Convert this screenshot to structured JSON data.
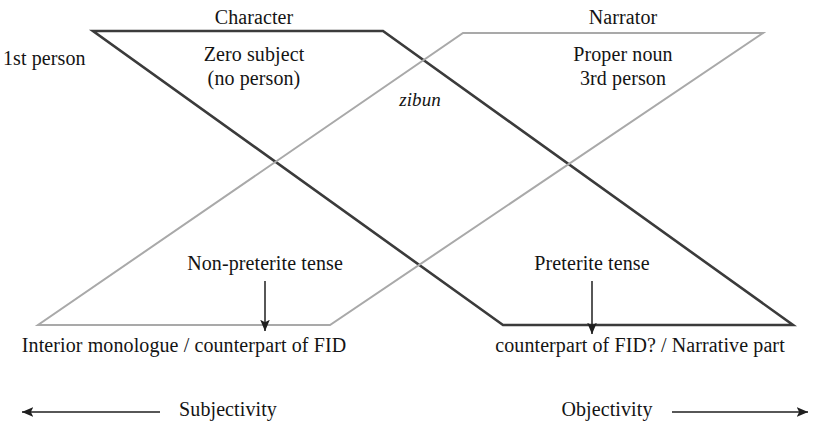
{
  "figure": {
    "colors": {
      "character_stroke": "#3b3b3b",
      "narrator_stroke": "#a9a9a9",
      "text": "#141414",
      "background": "#ffffff"
    }
  },
  "labels": {
    "character": "Character",
    "narrator": "Narrator",
    "first_person": "1st person",
    "zero_subject": "Zero subject\n(no person)",
    "zero_subject_line1": "Zero subject",
    "zero_subject_line2": "(no person)",
    "proper_noun_line1": "Proper noun",
    "proper_noun_line2": "3rd person",
    "zibun": "zibun",
    "non_preterite": "Non-preterite tense",
    "preterite": "Preterite tense",
    "interior_monologue": "Interior monologue / counterpart of FID",
    "narrative_part": "counterpart of FID? / Narrative part",
    "subjectivity": "Subjectivity",
    "objectivity": "Objectivity"
  },
  "shapes": {
    "character_parallelogram": {
      "name": "Character",
      "stroke": "#3b3b3b",
      "points": "93,31 383,31 793,325 503,325"
    },
    "narrator_parallelogram": {
      "name": "Narrator",
      "stroke": "#a9a9a9",
      "points": "463,33 763,33 330,325 38,325"
    }
  },
  "arrows": {
    "non_preterite_pointer": {
      "x": 265,
      "y_from": 281,
      "y_to": 331,
      "direction": "down"
    },
    "preterite_pointer": {
      "x": 592,
      "y_from": 281,
      "y_to": 334,
      "direction": "down"
    },
    "subjectivity_axis": {
      "y": 412,
      "x_from": 160,
      "x_to": 21,
      "direction": "left"
    },
    "objectivity_axis": {
      "y": 412,
      "x_from": 672,
      "x_to": 809,
      "direction": "right"
    }
  }
}
